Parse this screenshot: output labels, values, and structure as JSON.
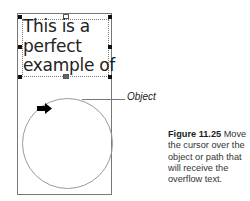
{
  "illustration": {
    "sample_text": [
      "This is a",
      "perfect",
      "example of"
    ],
    "object_label": "Object",
    "cursor_icon": "arrow-right-icon"
  },
  "caption": {
    "figure_number": "Figure 11.25",
    "text": " Move the cursor over the object or path that will receive the overflow text."
  }
}
